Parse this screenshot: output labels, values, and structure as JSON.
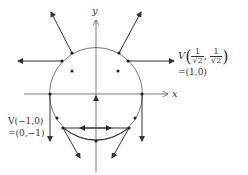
{
  "diagram": {
    "type": "vector-field-on-circle",
    "axes": {
      "x_label": "x",
      "y_label": "y"
    },
    "labels": {
      "top_right": {
        "line1_prefix": "V",
        "frac_num": "1",
        "frac_den": "√2",
        "separator": ",",
        "line2": "=(1,0)"
      },
      "bottom_left": {
        "line1": "V(−1,0)",
        "line2": "=(0,−1)"
      }
    },
    "colors": {
      "stroke": "#333333",
      "background": "#ffffff"
    }
  }
}
